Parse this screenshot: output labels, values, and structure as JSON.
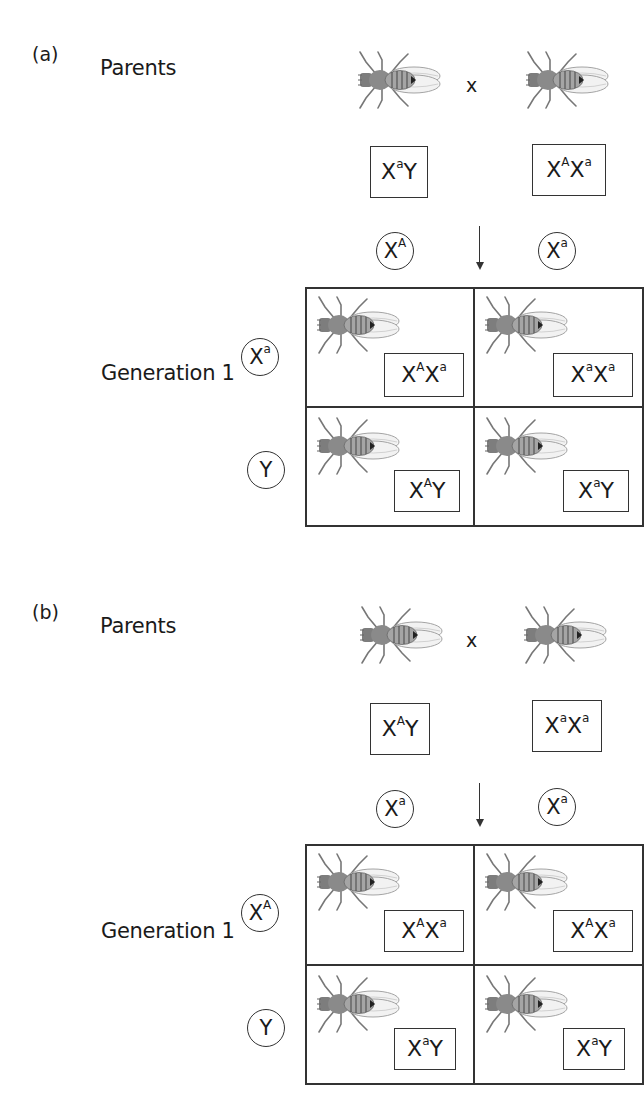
{
  "panels": [
    {
      "label": "(a)",
      "parents_label": "Parents",
      "cross_symbol": "x",
      "parents": [
        {
          "genotype": {
            "x": "X",
            "sup1": "a",
            "rest": "Y"
          },
          "text": "XaY",
          "icon": "fruit-fly-icon"
        },
        {
          "genotype": {
            "x": "X",
            "sup1": "A",
            "rest": "X",
            "sup2": "a"
          },
          "text": "XAXa",
          "icon": "fruit-fly-icon"
        }
      ],
      "column_gametes": [
        {
          "base": "X",
          "sup": "A",
          "text": "XA"
        },
        {
          "base": "X",
          "sup": "a",
          "text": "Xa"
        }
      ],
      "row_gametes": [
        {
          "base": "X",
          "sup": "a",
          "text": "Xa"
        },
        {
          "base": "Y",
          "sup": "",
          "text": "Y"
        }
      ],
      "generation_label": "Generation 1",
      "offspring": [
        [
          {
            "base1": "X",
            "sup1": "A",
            "base2": "X",
            "sup2": "a",
            "text": "XAXa"
          },
          {
            "base1": "X",
            "sup1": "a",
            "base2": "X",
            "sup2": "a",
            "text": "XaXa"
          }
        ],
        [
          {
            "base1": "X",
            "sup1": "A",
            "base2": "Y",
            "sup2": "",
            "text": "XAY"
          },
          {
            "base1": "X",
            "sup1": "a",
            "base2": "Y",
            "sup2": "",
            "text": "XaY"
          }
        ]
      ]
    },
    {
      "label": "(b)",
      "parents_label": "Parents",
      "cross_symbol": "x",
      "parents": [
        {
          "genotype": {
            "x": "X",
            "sup1": "A",
            "rest": "Y"
          },
          "text": "XAY",
          "icon": "fruit-fly-icon"
        },
        {
          "genotype": {
            "x": "X",
            "sup1": "a",
            "rest": "X",
            "sup2": "a"
          },
          "text": "XaXa",
          "icon": "fruit-fly-icon"
        }
      ],
      "column_gametes": [
        {
          "base": "X",
          "sup": "a",
          "text": "Xa"
        },
        {
          "base": "X",
          "sup": "a",
          "text": "Xa"
        }
      ],
      "row_gametes": [
        {
          "base": "X",
          "sup": "A",
          "text": "XA"
        },
        {
          "base": "Y",
          "sup": "",
          "text": "Y"
        }
      ],
      "generation_label": "Generation 1",
      "offspring": [
        [
          {
            "base1": "X",
            "sup1": "A",
            "base2": "X",
            "sup2": "a",
            "text": "XAXa"
          },
          {
            "base1": "X",
            "sup1": "A",
            "base2": "X",
            "sup2": "a",
            "text": "XAXa"
          }
        ],
        [
          {
            "base1": "X",
            "sup1": "a",
            "base2": "Y",
            "sup2": "",
            "text": "XaY"
          },
          {
            "base1": "X",
            "sup1": "a",
            "base2": "Y",
            "sup2": "",
            "text": "XaY"
          }
        ]
      ]
    }
  ],
  "colors": {
    "line": "#333333",
    "fly_body": "#8a8a8a",
    "fly_wing": "#c8c8c8",
    "background": "#ffffff"
  }
}
